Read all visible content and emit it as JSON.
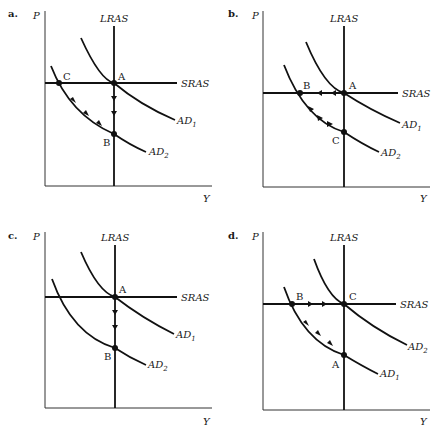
{
  "figure": {
    "panels": [
      {
        "id": "a",
        "label": "a.",
        "axes": {
          "y": "P",
          "x": "Y"
        },
        "curves": {
          "lras": "LRAS",
          "sras": "SRAS",
          "ad1": "AD",
          "ad1_sub": "1",
          "ad2": "AD",
          "ad2_sub": "2"
        },
        "points": {
          "A": "A",
          "B": "B",
          "C": "C"
        },
        "arrows": "Down along LRAS from A to B; up-left along AD2 from B to C"
      },
      {
        "id": "b",
        "label": "b.",
        "axes": {
          "y": "P",
          "x": "Y"
        },
        "curves": {
          "lras": "LRAS",
          "sras": "SRAS",
          "ad1": "AD",
          "ad1_sub": "1",
          "ad2": "AD",
          "ad2_sub": "2"
        },
        "points": {
          "A": "A",
          "B": "B",
          "C": "C"
        },
        "arrows": "Left along SRAS from A to B; down-right along AD2 from B to C"
      },
      {
        "id": "c",
        "label": "c.",
        "axes": {
          "y": "P",
          "x": "Y"
        },
        "curves": {
          "lras": "LRAS",
          "sras": "SRAS",
          "ad1": "AD",
          "ad1_sub": "1",
          "ad2": "AD",
          "ad2_sub": "2"
        },
        "points": {
          "A": "A",
          "B": "B"
        },
        "arrows": "Down along LRAS from A to B"
      },
      {
        "id": "d",
        "label": "d.",
        "axes": {
          "y": "P",
          "x": "Y"
        },
        "curves": {
          "lras": "LRAS",
          "sras": "SRAS",
          "ad1": "AD",
          "ad1_sub": "1",
          "ad2": "AD",
          "ad2_sub": "2"
        },
        "points": {
          "A": "A",
          "B": "B",
          "C": "C"
        },
        "arrows": "Up-left along AD1 from A to B; right along SRAS from B to C"
      }
    ]
  }
}
